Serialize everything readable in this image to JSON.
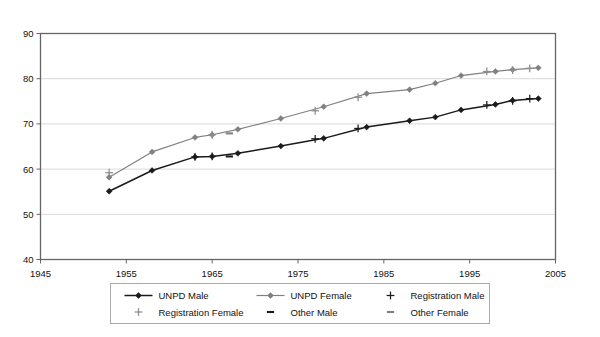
{
  "chart_data": {
    "type": "line",
    "title": "",
    "subtitle": "",
    "xlabel": "",
    "ylabel": "",
    "xlim": [
      1945,
      2005
    ],
    "ylim": [
      40,
      90
    ],
    "xticks": [
      1945,
      1955,
      1965,
      1975,
      1985,
      1995,
      2005
    ],
    "yticks": [
      40,
      50,
      60,
      70,
      80,
      90
    ],
    "grid": "horizontal",
    "legend_position": "bottom",
    "colors": {
      "male": "#1a1a1a",
      "female": "#808080",
      "grid": "#d9d9d9",
      "axis": "#666666",
      "plot_background": "#ffffff",
      "legend_border": "#aaaaaa"
    },
    "series": [
      {
        "name": "UNPD Male",
        "marker": "diamond",
        "line": true,
        "color": "#1a1a1a",
        "x": [
          1953,
          1958,
          1963,
          1965,
          1968,
          1973,
          1978,
          1983,
          1988,
          1991,
          1994,
          1998,
          2000,
          2003
        ],
        "values": [
          55.1,
          59.7,
          62.7,
          62.8,
          63.5,
          65.1,
          66.8,
          69.3,
          70.7,
          71.5,
          73.1,
          74.3,
          75.2,
          75.6
        ]
      },
      {
        "name": "UNPD Female",
        "marker": "diamond",
        "line": true,
        "color": "#808080",
        "x": [
          1953,
          1958,
          1963,
          1965,
          1968,
          1973,
          1978,
          1983,
          1988,
          1991,
          1994,
          1998,
          2000,
          2003
        ],
        "values": [
          58.2,
          63.8,
          67.0,
          67.6,
          68.8,
          71.2,
          73.8,
          76.7,
          77.6,
          79.0,
          80.7,
          81.6,
          82.0,
          82.4
        ]
      },
      {
        "name": "Registration Male",
        "marker": "plus",
        "line": false,
        "color": "#1a1a1a",
        "x": [
          1963,
          1965,
          1977,
          1982,
          1997,
          2000,
          2002
        ],
        "values": [
          62.7,
          62.8,
          66.7,
          69.0,
          74.2,
          75.1,
          75.6
        ]
      },
      {
        "name": "Registration Female",
        "marker": "plus",
        "line": false,
        "color": "#8c8c8c",
        "x": [
          1953,
          1965,
          1977,
          1982,
          1997,
          2000,
          2002
        ],
        "values": [
          59.2,
          67.6,
          72.9,
          75.9,
          81.6,
          81.9,
          82.3
        ]
      },
      {
        "name": "Other Male",
        "marker": "dash",
        "line": false,
        "color": "#1a1a1a",
        "x": [
          1967
        ],
        "values": [
          62.8
        ]
      },
      {
        "name": "Other Female",
        "marker": "dash",
        "line": false,
        "color": "#808080",
        "x": [
          1967
        ],
        "values": [
          67.9
        ]
      }
    ],
    "legend": [
      {
        "label": "UNPD Male",
        "marker": "line-diamond",
        "color": "#1a1a1a"
      },
      {
        "label": "UNPD Female",
        "marker": "line-diamond",
        "color": "#808080"
      },
      {
        "label": "Registration Male",
        "marker": "plus",
        "color": "#1a1a1a"
      },
      {
        "label": "Registration Female",
        "marker": "plus",
        "color": "#8c8c8c"
      },
      {
        "label": "Other Male",
        "marker": "dash",
        "color": "#1a1a1a"
      },
      {
        "label": "Other Female",
        "marker": "dash",
        "color": "#808080"
      }
    ]
  },
  "axis": {
    "y_labels": [
      "90",
      "80",
      "70",
      "60",
      "50",
      "40"
    ],
    "x_labels": [
      "1945",
      "1955",
      "1965",
      "1975",
      "1985",
      "1995",
      "2005"
    ]
  },
  "legend": {
    "items": [
      "UNPD Male",
      "UNPD Female",
      "Registration Male",
      "Registration Female",
      "Other Male",
      "Other Female"
    ]
  }
}
